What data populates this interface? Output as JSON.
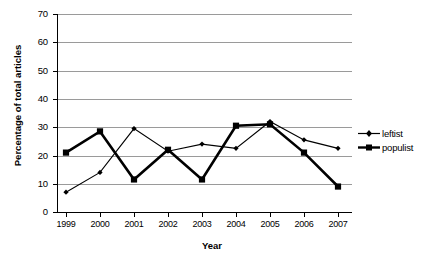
{
  "chart_data": {
    "type": "line",
    "title": "",
    "xlabel": "Year",
    "ylabel": "Percentage of total articles",
    "categories": [
      "1999",
      "2000",
      "2001",
      "2002",
      "2003",
      "2004",
      "2005",
      "2006",
      "2007"
    ],
    "ylim": [
      0,
      70
    ],
    "yticks": [
      0,
      10,
      20,
      30,
      40,
      50,
      60,
      70
    ],
    "grid": true,
    "legend_position": "right",
    "series": [
      {
        "name": "leftist",
        "marker": "diamond",
        "line_width": "thin",
        "color": "#000000",
        "values": [
          7,
          14,
          29.5,
          21.5,
          24,
          22.5,
          32,
          25.5,
          22.5
        ]
      },
      {
        "name": "populist",
        "marker": "square",
        "line_width": "thick",
        "color": "#000000",
        "values": [
          21,
          28.5,
          11.5,
          22,
          11.5,
          30.5,
          31,
          21,
          9
        ]
      }
    ]
  },
  "axes": {
    "x_title": "Year",
    "y_title": "Percentage of total articles",
    "y_tick_labels": [
      "70",
      "60",
      "50",
      "40",
      "30",
      "20",
      "10",
      "0"
    ],
    "x_tick_labels": [
      "1999",
      "2000",
      "2001",
      "2002",
      "2003",
      "2004",
      "2005",
      "2006",
      "2007"
    ]
  },
  "legend": {
    "items": [
      {
        "label": "leftist"
      },
      {
        "label": "populist"
      }
    ]
  },
  "colors": {
    "series": "#000000",
    "grid": "#9a9a9a",
    "axis": "#000000",
    "background": "#ffffff"
  }
}
